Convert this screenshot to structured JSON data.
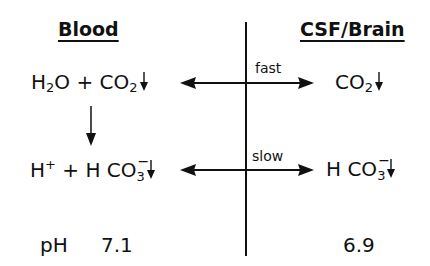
{
  "headings": {
    "left": "Blood",
    "right": "CSF/Brain"
  },
  "blood": {
    "row1": {
      "h2o_H": "H",
      "h2o_sub": "2",
      "h2o_O": "O",
      "plus": "+",
      "co2_CO": "CO",
      "co2_sub": "2"
    },
    "row2": {
      "h": "H",
      "h_charge": "+",
      "plus": "+",
      "hco3_H": "H",
      "hco3_CO": "CO",
      "hco3_sub": "3",
      "hco3_charge": "−"
    },
    "ph_label": "pH",
    "ph_value": "7.1"
  },
  "csf": {
    "row1": {
      "co2_CO": "CO",
      "co2_sub": "2"
    },
    "row2": {
      "hco3_H": "H",
      "hco3_CO": "CO",
      "hco3_sub": "3",
      "hco3_charge": "−"
    },
    "ph_value": "6.9"
  },
  "exchange": {
    "co2_rate": "fast",
    "hco3_rate": "slow"
  },
  "icons": {
    "decrease": "down-arrow-icon",
    "exchange": "double-headed-arrow-icon",
    "reaction": "reaction-arrow-icon"
  },
  "colors": {
    "ink": "#111111",
    "background": "#ffffff"
  }
}
